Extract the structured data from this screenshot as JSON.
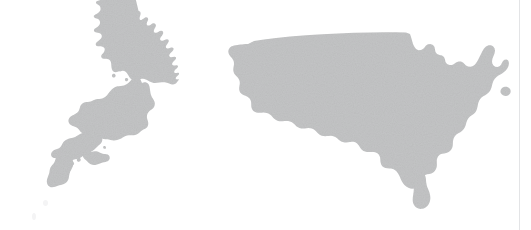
{
  "figure": {
    "title": "",
    "background_color": "#ffffff",
    "width": 531,
    "height": 230
  },
  "rule": {
    "name": "right-vertical-rule",
    "color": "#e3e4e6",
    "x": 519,
    "width": 1
  },
  "maps": [
    {
      "id": "japan",
      "label": "Japan",
      "caption": "",
      "fill_color": "#c3c4c5",
      "position": {
        "x": 0,
        "y": 0,
        "width": 230,
        "height": 230
      }
    },
    {
      "id": "usa",
      "label": "United States",
      "caption": "",
      "fill_color": "#c3c4c5",
      "position": {
        "x": 220,
        "y": 0,
        "width": 311,
        "height": 230
      }
    }
  ],
  "chart_data": {
    "type": "map",
    "title": "",
    "subtitle": "",
    "xlabel": "",
    "ylabel": "",
    "legend": [],
    "annotations": [],
    "regions": [
      {
        "name": "Japan",
        "fill": "#c3c4c5",
        "value": null
      },
      {
        "name": "United States (contiguous)",
        "fill": "#c3c4c5",
        "value": null
      }
    ],
    "grid": false,
    "legend_position": "none"
  }
}
